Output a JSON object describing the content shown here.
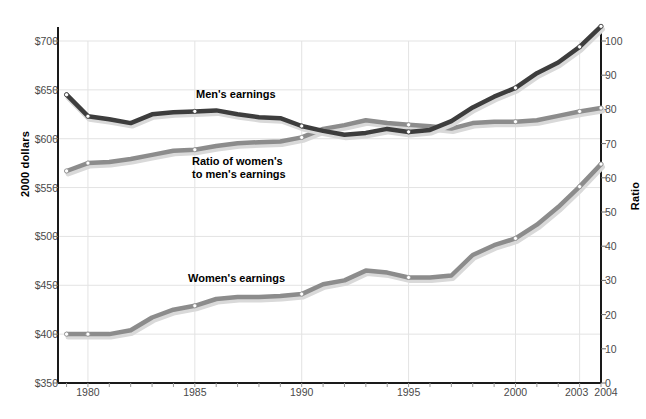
{
  "chart_data": {
    "type": "line",
    "title": "",
    "xlabel": "",
    "ylabel": "2000 dollars",
    "ylabel_right": "Ratio",
    "xlim": [
      1978.6,
      2004
    ],
    "ylim": [
      350,
      700
    ],
    "ylim_right": [
      0,
      100
    ],
    "grid": true,
    "legend_position": "inline-annotations",
    "x_ticks": [
      "1980",
      "1985",
      "1990",
      "1995",
      "2000",
      "2003",
      "2004"
    ],
    "x_tick_values": [
      1980,
      1985,
      1990,
      1995,
      2000,
      2003,
      2004
    ],
    "y_ticks_left": [
      "$350",
      "$400",
      "$450",
      "$500",
      "$550",
      "$600",
      "$650",
      "$700"
    ],
    "y_tick_values_left": [
      350,
      400,
      450,
      500,
      550,
      600,
      650,
      700
    ],
    "y_ticks_right": [
      "0",
      "10",
      "20",
      "30",
      "40",
      "50",
      "60",
      "70",
      "80",
      "90",
      "100"
    ],
    "y_tick_values_right": [
      0,
      10,
      20,
      30,
      40,
      50,
      60,
      70,
      80,
      90,
      100
    ],
    "x": [
      1979,
      1980,
      1981,
      1982,
      1983,
      1984,
      1985,
      1986,
      1987,
      1988,
      1989,
      1990,
      1991,
      1992,
      1993,
      1994,
      1995,
      1996,
      1997,
      1998,
      1999,
      2000,
      2001,
      2002,
      2003,
      2004
    ],
    "series": [
      {
        "name": "Men's earnings",
        "axis": "left",
        "color": "#3d3d3d",
        "values": [
          645,
          623,
          620,
          616,
          625,
          627,
          628,
          629,
          625,
          622,
          621,
          613,
          608,
          604,
          606,
          610,
          607,
          609,
          618,
          632,
          643,
          652,
          667,
          678,
          694,
          715
        ]
      },
      {
        "name": "Ratio of women's to men's earnings",
        "axis": "right",
        "color": "#8c8c8c",
        "values": [
          62.0,
          64.3,
          64.6,
          65.5,
          66.7,
          67.9,
          68.2,
          69.3,
          70.1,
          70.4,
          70.6,
          71.8,
          74.3,
          75.4,
          76.8,
          76.0,
          75.5,
          75.1,
          74.4,
          76.0,
          76.4,
          76.4,
          76.8,
          78.1,
          79.4,
          80.4
        ]
      },
      {
        "name": "Women's earnings",
        "axis": "left",
        "color": "#8c8c8c",
        "values": [
          400,
          400,
          400,
          404,
          417,
          425,
          429,
          436,
          438,
          438,
          439,
          441,
          451,
          455,
          465,
          463,
          458,
          458,
          460,
          481,
          491,
          498,
          512,
          530,
          551,
          574
        ]
      }
    ],
    "annotations": [
      {
        "text": "Men's earnings",
        "x": 1984.2,
        "series": "Men's earnings"
      },
      {
        "text": "Ratio of women's",
        "x": 1984.0,
        "series": "Ratio of women's to men's earnings"
      },
      {
        "text": "to men's earnings",
        "x": 1984.0,
        "series": "Ratio of women's to men's earnings"
      },
      {
        "text": "Women's earnings",
        "x": 1983.8,
        "series": "Women's earnings"
      }
    ]
  },
  "labels": {
    "men": "Men's earnings",
    "ratio_line1": "Ratio of women's",
    "ratio_line2": "to men's earnings",
    "women": "Women's earnings",
    "axis_left": "2000 dollars",
    "axis_right": "Ratio"
  }
}
